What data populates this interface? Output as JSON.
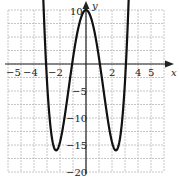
{
  "chart_data": {
    "type": "line",
    "title": "",
    "xlabel": "x",
    "ylabel": "y",
    "xlim": [
      -6,
      6
    ],
    "ylim": [
      -20,
      10
    ],
    "grid": true,
    "x_tick_labels": [
      "-5",
      "-4",
      "-2",
      "2",
      "4",
      "5"
    ],
    "x_ticks": [
      -5,
      -4,
      -2,
      2,
      4,
      5
    ],
    "y_tick_labels": [
      "10",
      "5",
      "-10",
      "-15",
      "-20"
    ],
    "y_ticks": [
      10,
      -5,
      -10,
      -15,
      -20
    ],
    "series": [
      {
        "name": "polynomial curve",
        "description": "Even quartic (W-shape): local max (0,10), local minima near (-2.3,-16) and (2.3,-16), x-intercepts near ±1.1 and ±3.1, arrows on both ends pointing upward",
        "x": [
          -3.4,
          -3.07,
          -2.8,
          -2.3,
          -1.8,
          -1.07,
          -0.5,
          0,
          0.5,
          1.07,
          1.8,
          2.3,
          2.8,
          3.07,
          3.4
        ],
        "y": [
          10.5,
          0,
          -6.3,
          -16,
          -11.4,
          0,
          7.6,
          10,
          7.6,
          0,
          -11.4,
          -16,
          -6.3,
          0,
          10.5
        ]
      }
    ]
  },
  "axis_labels": {
    "x": "x",
    "y": "y"
  },
  "ticks": {
    "x_neg5": "−5",
    "x_neg4": "−4",
    "x_neg2": "−2",
    "x_2": "2",
    "x_4": "4",
    "x_5": "5",
    "y_10": "10",
    "y_5": "−5",
    "y_10n": "−10",
    "y_15n": "−15",
    "y_20n": "−20"
  },
  "colors": {
    "curve": "#111111",
    "grid": "#b8b8b8",
    "axis": "#222222"
  }
}
